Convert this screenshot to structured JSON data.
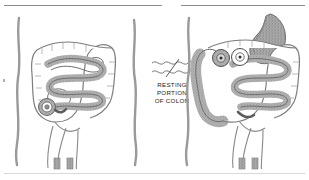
{
  "page": {
    "background_color": "#ffffff",
    "width": 309,
    "height": 180
  },
  "rules": {
    "top_left_present": true,
    "top_right_present": true,
    "bottom_present": true,
    "color": "#8c8c8c"
  },
  "legend": {
    "icon_name": "wavy-lines-slash-icon",
    "line1": "RESTING",
    "line2": "PORTION",
    "line3": "OF COLON",
    "text_color": "#1a1a1a"
  },
  "figures": [
    {
      "id": "figure-left",
      "caption": "",
      "body_outline_color": "#8a8a8a",
      "organs": {
        "stomach": {
          "name": "stomach",
          "fill": "#a9a9a9",
          "shaded": true
        },
        "colon": {
          "name": "large-intestine-colon",
          "fill": "#ffffff",
          "shaded": false
        },
        "small_intestine": {
          "name": "small-intestine",
          "fill": "#9e9e9e",
          "shaded": true
        },
        "spiral_coil": {
          "name": "ileocecal-coil",
          "fill": "#9e9e9e",
          "shaded": true
        },
        "markers": []
      }
    },
    {
      "id": "figure-right",
      "caption": "",
      "body_outline_color": "#8a8a8a",
      "organs": {
        "stomach": {
          "name": "stomach",
          "fill": "#a9a9a9",
          "shaded": true
        },
        "colon": {
          "name": "large-intestine-colon",
          "fill": "#ffffff",
          "shaded": false
        },
        "descending_colon": {
          "name": "descending-colon-shaded",
          "fill": "#a9a9a9",
          "shaded": true
        },
        "small_intestine": {
          "name": "small-intestine",
          "fill": "#9e9e9e",
          "shaded": true
        },
        "markers": [
          {
            "name": "cross-section-marker-gray",
            "fill": "#a9a9a9"
          },
          {
            "name": "cross-section-marker-white",
            "fill": "#ffffff"
          }
        ]
      }
    }
  ]
}
